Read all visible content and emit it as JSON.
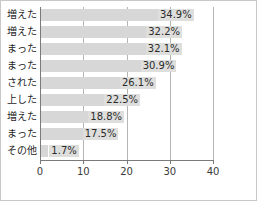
{
  "chart_data": {
    "type": "bar",
    "orientation": "horizontal",
    "title": "",
    "xlabel": "",
    "ylabel": "",
    "xlim": [
      0,
      40
    ],
    "xticks": [
      "0",
      "10",
      "20",
      "30",
      "40"
    ],
    "grid": true,
    "legend": false,
    "unit": "%",
    "categories": [
      "増えた",
      "増えた",
      "まった",
      "まった",
      "された",
      "上した",
      "増えた",
      "まった",
      "その他"
    ],
    "values": [
      34.9,
      32.2,
      32.1,
      30.9,
      26.1,
      22.5,
      18.8,
      17.5,
      1.7
    ],
    "value_labels": [
      "34.9%",
      "32.2%",
      "32.1%",
      "30.9%",
      "26.1%",
      "22.5%",
      "18.8%",
      "17.5%",
      "1.7%"
    ]
  },
  "colors": {
    "bar_fill": "#d7d7d7",
    "axis": "#7a7a7a",
    "gridline": "#b5b5b5",
    "text": "#1f1f1f",
    "frame": "#c8c8c8",
    "value_label_bg": "#dededc"
  }
}
